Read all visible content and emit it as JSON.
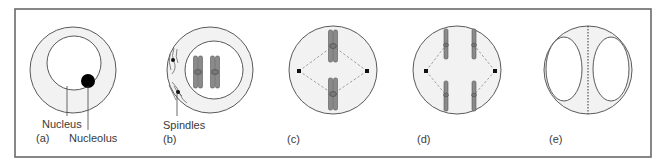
{
  "figure": {
    "colors": {
      "frame": "#6a6a6a",
      "outline": "#5a5a5a",
      "cytoplasm": "#f2f2f2",
      "nucleus_fill": "#ffffff",
      "nucleolus": "#000000",
      "chromosome": "#8a8a8a",
      "pole": "#111111",
      "spindle_dash": "#8a8a8a",
      "label": "#3a3a3a"
    },
    "panels": [
      {
        "id": "a",
        "label": "(a)",
        "annotations": [
          "Nucleus",
          "Nucleolus"
        ]
      },
      {
        "id": "b",
        "label": "(b)",
        "annotations": [
          "Spindles"
        ]
      },
      {
        "id": "c",
        "label": "(c)",
        "annotations": []
      },
      {
        "id": "d",
        "label": "(d)",
        "annotations": []
      },
      {
        "id": "e",
        "label": "(e)",
        "annotations": []
      }
    ]
  }
}
